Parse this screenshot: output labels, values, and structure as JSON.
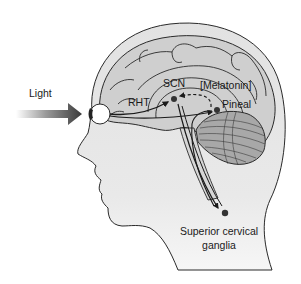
{
  "diagram": {
    "colors": {
      "background": "#ffffff",
      "head_fill": "#e6e6e6",
      "brain_fill": "#cfcfcf",
      "cerebellum_fill": "#a8a8a8",
      "outline": "#2a2a2a",
      "node": "#333333",
      "arrow": "#1a1a1a"
    },
    "labels": {
      "light": "Light",
      "rht": "RHT",
      "scn": "SCN",
      "melatonin": "[Melatonin]",
      "pineal": "Pineal",
      "ganglia_line1": "Superior cervical",
      "ganglia_line2": "ganglia"
    },
    "nodes": [
      {
        "id": "scn",
        "label": "SCN",
        "x": 174,
        "y": 99
      },
      {
        "id": "pineal",
        "label": "Pineal",
        "x": 217,
        "y": 110
      },
      {
        "id": "ganglia",
        "label": "Superior cervical ganglia",
        "x": 225,
        "y": 213
      }
    ],
    "edges": [
      {
        "from": "light",
        "to": "eye",
        "style": "gradient-block-arrow"
      },
      {
        "from": "eye",
        "to": "scn",
        "label": "RHT",
        "style": "solid-arrow"
      },
      {
        "from": "pineal",
        "to": "scn",
        "label": "[Melatonin]",
        "style": "dashed-arrow"
      },
      {
        "from": "scn",
        "to": "ganglia",
        "style": "solid-arrow"
      },
      {
        "from": "ganglia",
        "to": "pineal",
        "style": "solid-arrow"
      }
    ]
  }
}
